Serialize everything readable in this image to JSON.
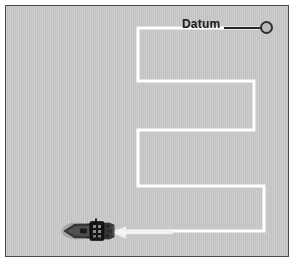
{
  "figure": {
    "background_color": "#c8c8c8",
    "border_color": "#4a4a4a",
    "track_color": "#ffffff",
    "ink_color": "#1a1a1a"
  },
  "labels": {
    "datum": "Datum"
  },
  "markers": {
    "datum_dot": {
      "name": "datum-marker",
      "shape": "circle",
      "fill": "#b9b9b9",
      "stroke": "#303030",
      "cx": 260.5,
      "cy": 21.5,
      "r": 5.5
    },
    "leader_line": {
      "name": "datum-leader-line",
      "x1": 218,
      "y1": 22,
      "x2": 256,
      "y2": 22,
      "color": "#2a2a2a"
    }
  },
  "vessel": {
    "name": "ship",
    "heading": "west",
    "x": 56,
    "y": 210,
    "width": 56,
    "height": 30,
    "hull_color": "#3d3d3d",
    "deck_color": "#1c1c1c",
    "wake_color": "#8f8f8f"
  },
  "direction_arrow": {
    "name": "direction-of-travel-arrow",
    "points_to": "west",
    "color": "#f2f2f2",
    "x": 105,
    "y": 219,
    "length": 62
  },
  "chart_data": {
    "type": "line",
    "xlabel": "",
    "ylabel": "",
    "grid": false,
    "legend": null,
    "xlim": [
      0,
      284
    ],
    "ylim": [
      0,
      252
    ],
    "annotations": [
      {
        "text": "Datum",
        "x": 176,
        "y": 12
      }
    ],
    "series": [
      {
        "name": "search-track",
        "color": "#ffffff",
        "width": 3,
        "points": [
          [
            260,
            22
          ],
          [
            260,
            22
          ],
          [
            132,
            22
          ],
          [
            132,
            75
          ],
          [
            248,
            75
          ],
          [
            248,
            124
          ],
          [
            132,
            124
          ],
          [
            132,
            180
          ],
          [
            258,
            180
          ],
          [
            258,
            225
          ],
          [
            110,
            225
          ]
        ]
      }
    ]
  },
  "track": {
    "name": "search-track-path",
    "stroke": "#ffffff",
    "stroke_width": 3,
    "path": "M 260 22 L 132 22 L 132 75 L 248 75 L 248 124 L 132 124 L 132 180 L 258 180 L 258 225 L 110 225"
  }
}
